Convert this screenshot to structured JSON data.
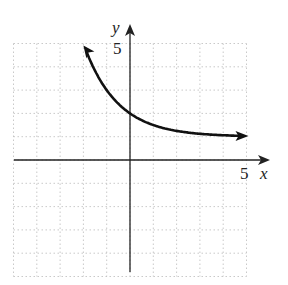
{
  "chart_data": {
    "type": "line",
    "title": "",
    "xlabel": "x",
    "ylabel": "y",
    "xlim": [
      -5,
      5
    ],
    "ylim": [
      -5,
      5
    ],
    "grid": true,
    "tick_labels": {
      "x": [
        "5"
      ],
      "y": [
        "5"
      ]
    },
    "series": [
      {
        "name": "y = (1/2)^x + 1",
        "x": [
          -2,
          -1,
          0,
          1,
          2,
          3,
          4,
          5
        ],
        "y": [
          5,
          3,
          2,
          1.5,
          1.25,
          1.125,
          1.0625,
          1.03
        ]
      }
    ],
    "asymptote": {
      "y": 1
    },
    "arrows": "both ends"
  },
  "labels": {
    "x_axis": "x",
    "y_axis": "y",
    "x_tick": "5",
    "y_tick": "5"
  }
}
